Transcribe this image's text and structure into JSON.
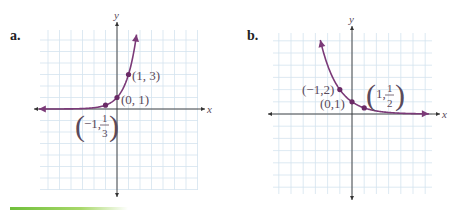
{
  "colors": {
    "curve": "#7b3a78",
    "point": "#6a2a66",
    "grid": "#d4e3ef",
    "axis": "#333333",
    "accent_bar": "#7cc444"
  },
  "chart_data": [
    {
      "panel_label": "a.",
      "type": "line",
      "function": "y = 3^x",
      "xlabel": "x",
      "ylabel": "y",
      "xlim": [
        -7,
        7
      ],
      "ylim": [
        -7,
        7
      ],
      "grid": true,
      "points": [
        {
          "x": -1,
          "y": 0.3333,
          "label_parts": [
            "−1,",
            "1",
            "3"
          ],
          "label": "(−1, 1/3)"
        },
        {
          "x": 0,
          "y": 1,
          "label": "(0, 1)"
        },
        {
          "x": 1,
          "y": 3,
          "label": "(1, 3)"
        }
      ],
      "curve_range": [
        -6.8,
        1.7
      ]
    },
    {
      "panel_label": "b.",
      "type": "line",
      "function": "y = (1/2)^x",
      "xlabel": "x",
      "ylabel": "y",
      "xlim": [
        -7,
        7
      ],
      "ylim": [
        -7,
        7
      ],
      "grid": true,
      "points": [
        {
          "x": -1,
          "y": 2,
          "label": "(−1,2)"
        },
        {
          "x": 0,
          "y": 1,
          "label": "(0,1)"
        },
        {
          "x": 1,
          "y": 0.5,
          "label_parts": [
            "1,",
            "1",
            "2"
          ],
          "label": "(1, 1/2)"
        }
      ],
      "curve_range": [
        -2.6,
        6.3
      ]
    }
  ]
}
